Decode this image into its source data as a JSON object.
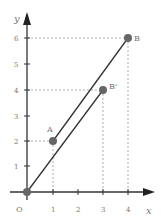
{
  "diagram": {
    "axes": {
      "x_label": "x",
      "y_label": "y",
      "origin_label": "O",
      "x_ticks": [
        "1",
        "2",
        "3",
        "4"
      ],
      "y_ticks": [
        "1",
        "2",
        "3",
        "4",
        "5",
        "6"
      ]
    },
    "points": [
      {
        "name": "O",
        "x": 0,
        "y": 0
      },
      {
        "name": "A",
        "x": 1,
        "y": 2
      },
      {
        "name": "B",
        "x": 4,
        "y": 6
      },
      {
        "name": "B'",
        "x": 3,
        "y": 4
      }
    ],
    "segments": [
      {
        "from": "A",
        "to": "B"
      },
      {
        "from": "O",
        "to": "B'"
      }
    ],
    "labels": {
      "A": "A",
      "B": "B",
      "B_prime": "B'"
    },
    "colors": {
      "axis": "#333333",
      "point": "#666666",
      "line": "#333333",
      "dashed": "#999999",
      "text": "#777777"
    }
  }
}
